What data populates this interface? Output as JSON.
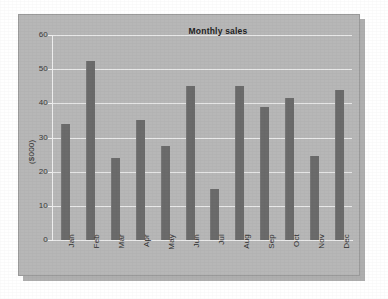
{
  "chart_data": {
    "type": "bar",
    "title": "Monthly sales",
    "xlabel": "",
    "ylabel": "($000)",
    "categories": [
      "Jan",
      "Feb",
      "Mar",
      "Apr",
      "May",
      "Jun",
      "Jul",
      "Aug",
      "Sep",
      "Oct",
      "Nov",
      "Dec"
    ],
    "values": [
      34,
      52.5,
      24,
      35,
      27.5,
      45,
      15,
      45,
      39,
      41.5,
      24.5,
      44
    ],
    "ylim": [
      0,
      60
    ],
    "ytick_labels": [
      "60",
      "50",
      "40",
      "30",
      "20",
      "10",
      "0"
    ],
    "ytick_values": [
      60,
      50,
      40,
      30,
      20,
      10,
      0
    ],
    "grid": true,
    "legend": false,
    "series_name": "Monthly sales",
    "bar_color": "#6b6b6b",
    "panel_color": "#b7b7b7",
    "gridline_color": "#e9e9e9",
    "page_background": "#ffffff"
  }
}
